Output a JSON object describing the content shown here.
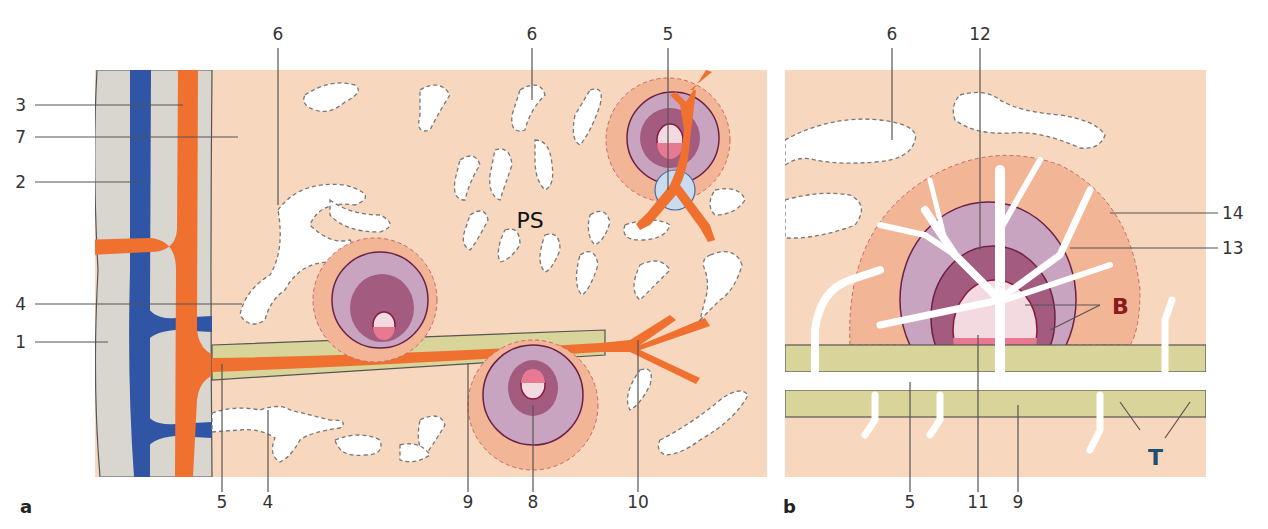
{
  "figure": {
    "panels": [
      {
        "id": "a",
        "label": "a"
      },
      {
        "id": "b",
        "label": "b"
      }
    ],
    "colors": {
      "background_tissue": "#f7d7be",
      "capsule": "#d9d6d0",
      "vein": "#2f55a4",
      "artery": "#f07030",
      "periarterial_sheath": "#d9d49a",
      "marginal_zone": "#f2b596",
      "corona": "#c9a4c0",
      "mantle": "#a35b80",
      "germinal_center_light": "#f3d9e0",
      "germinal_center_dark": "#e77a92",
      "B_label": "#8b1a1a",
      "T_label": "#1f5070",
      "sinus": "#ffffff"
    }
  },
  "panel_a": {
    "labels_left": [
      "3",
      "7",
      "2",
      "4",
      "1"
    ],
    "labels_top": [
      "6",
      "6",
      "5"
    ],
    "labels_bottom": [
      "5",
      "4",
      "9",
      "8",
      "10"
    ],
    "region_text": "PS"
  },
  "panel_b": {
    "labels_top": [
      "6",
      "12"
    ],
    "labels_right": [
      "14",
      "13"
    ],
    "labels_bottom": [
      "5",
      "11",
      "9"
    ],
    "zone_B": "B",
    "zone_T": "T"
  }
}
